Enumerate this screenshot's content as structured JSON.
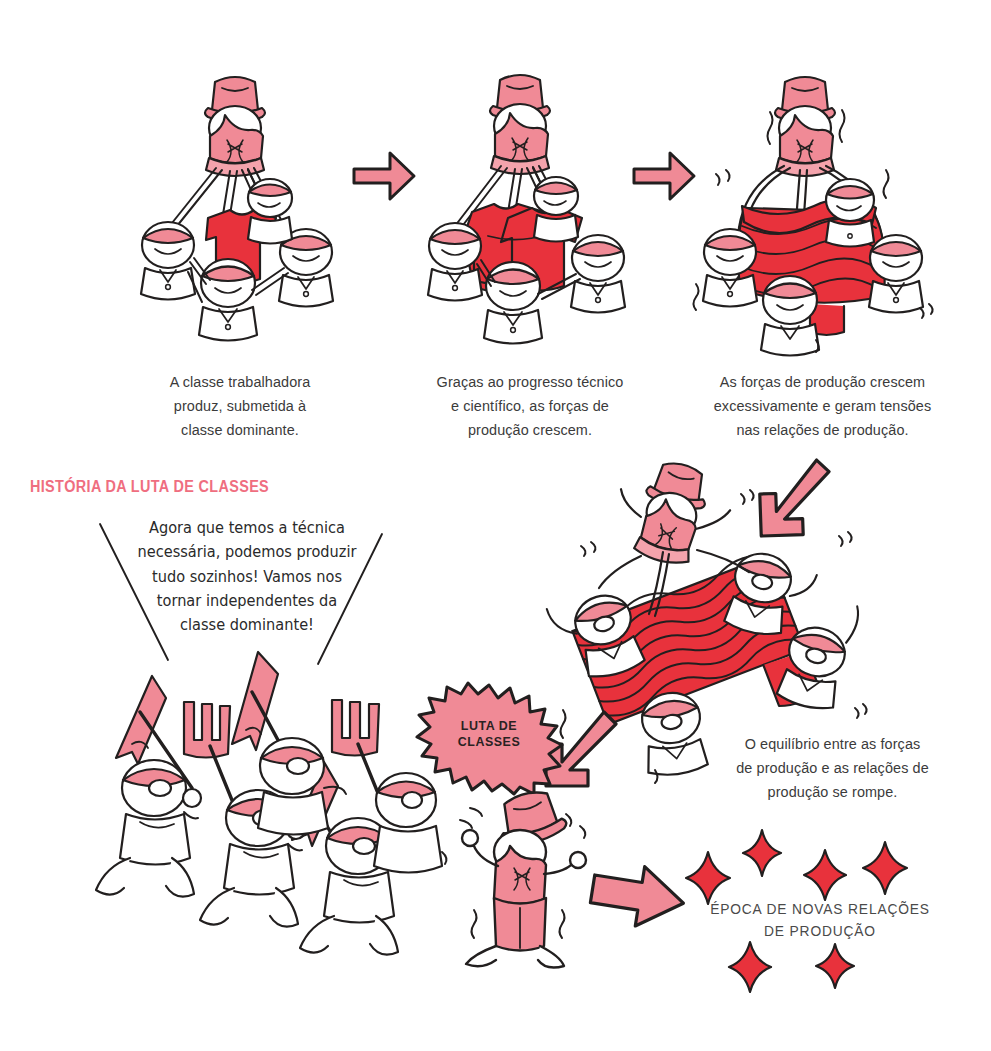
{
  "page": {
    "width": 991,
    "height": 1051,
    "background": "#ffffff",
    "title_text": "HISTÓRIA DA LUTA DE CLASSES"
  },
  "colors": {
    "pink": "#f08a96",
    "pink_light": "#f4a3ac",
    "red": "#e8323c",
    "red_dark": "#d4202b",
    "ink": "#221f1f",
    "caption_gray": "#3b3b3b",
    "heading_pink": "#ef6e80"
  },
  "panels": [
    {
      "id": "panel-1",
      "caption": "A classe trabalhadora\nproduz, submetida à\nclasse dominante.",
      "caption_lines": [
        "A classe trabalhadora",
        "produz, submetida à",
        "classe dominante."
      ]
    },
    {
      "id": "panel-2",
      "caption": "Graças ao progresso técnico\ne científico, as forças de\nprodução crescem.",
      "caption_lines": [
        "Graças ao progresso técnico",
        "e científico, as forças de",
        "produção crescem."
      ]
    },
    {
      "id": "panel-3",
      "caption": "As forças de produção crescem\nexcessivamente e geram tensões\nnas relações de produção.",
      "caption_lines": [
        "As forças de produção crescem",
        "excessivamente e geram tensões",
        "nas relações de produção."
      ]
    }
  ],
  "section": {
    "heading": "HISTÓRIA DA LUTA DE CLASSES"
  },
  "speech_balloon": {
    "lines": [
      "Agora que temos a técnica",
      "necessária, podemos produzir",
      "tudo sozinhos! Vamos nos",
      "tornar independentes da",
      "classe dominante!"
    ]
  },
  "starburst": {
    "label_lines": [
      "LUTA DE",
      "CLASSES"
    ],
    "fill": "#f08a96"
  },
  "break_caption": {
    "lines": [
      "O equilíbrio entre as forças",
      "de produção e as relações de",
      "produção se rompe."
    ]
  },
  "era_caption": {
    "lines": [
      "ÉPOCA DE NOVAS RELAÇÕES",
      "DE PRODUÇÃO"
    ]
  },
  "sparkles": {
    "count": 6,
    "color": "#e8323c",
    "positions": [
      {
        "x": 708,
        "y": 878,
        "r": 19
      },
      {
        "x": 762,
        "y": 852,
        "r": 17
      },
      {
        "x": 825,
        "y": 875,
        "r": 18
      },
      {
        "x": 885,
        "y": 868,
        "r": 19
      },
      {
        "x": 750,
        "y": 968,
        "r": 17
      },
      {
        "x": 835,
        "y": 966,
        "r": 16
      }
    ]
  },
  "arrows": [
    {
      "id": "arrow-panel1-to-panel2",
      "direction": "right"
    },
    {
      "id": "arrow-panel2-to-panel3",
      "direction": "right"
    },
    {
      "id": "arrow-panel3-to-tilt",
      "direction": "down-left"
    },
    {
      "id": "arrow-tilt-to-march",
      "direction": "down-left"
    },
    {
      "id": "arrow-capitalist-to-era",
      "direction": "right"
    }
  ]
}
